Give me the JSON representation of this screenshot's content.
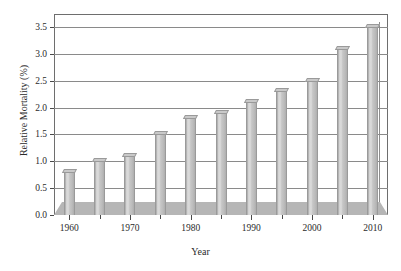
{
  "chart_data": {
    "type": "bar",
    "title": "",
    "xlabel": "Year",
    "ylabel": "Relative Mortality (%)",
    "categories": [
      1960,
      1965,
      1970,
      1975,
      1980,
      1985,
      1990,
      1995,
      2000,
      2005,
      2010
    ],
    "values": [
      0.8,
      1.0,
      1.1,
      1.5,
      1.8,
      1.9,
      2.1,
      2.3,
      2.5,
      3.1,
      3.5
    ],
    "series": [
      {
        "name": "Relative Mortality",
        "values": [
          0.8,
          1.0,
          1.1,
          1.5,
          1.8,
          1.9,
          2.1,
          2.3,
          2.5,
          3.1,
          3.5
        ]
      }
    ],
    "ylim": [
      0.0,
      3.5
    ],
    "xlim": [
      1957.5,
      2012.5
    ],
    "yticks": [
      "0.0",
      "0.5",
      "1.0",
      "1.5",
      "2.0",
      "2.5",
      "3.0",
      "3.5"
    ],
    "ytick_values": [
      0.0,
      0.5,
      1.0,
      1.5,
      2.0,
      2.5,
      3.0,
      3.5
    ],
    "xticks": [
      "1960",
      "1970",
      "1980",
      "1990",
      "2000",
      "2010"
    ],
    "xtick_values": [
      1960,
      1970,
      1980,
      1990,
      2000,
      2010
    ],
    "xtick_minor_values": [
      1965,
      1975,
      1985,
      1995,
      2005
    ],
    "grid": "horizontal",
    "legend": "none",
    "style_3d": true,
    "colors": {
      "bar_face": "#c6c6c6",
      "bar_highlight": "#dcdcdc",
      "bar_edge": "#9a9a9a",
      "floor": "#b6b6b6",
      "gridline": "#8a8a8a",
      "frame": "#6e6e6e",
      "text": "#2b2b2b",
      "background": "#ffffff"
    }
  }
}
